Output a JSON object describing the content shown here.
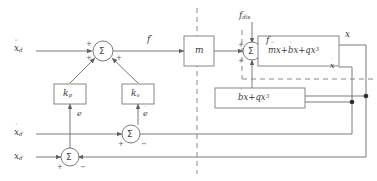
{
  "diagram": {
    "inputs": {
      "accel_ref": {
        "base": "x",
        "accent": "¨",
        "subscript": "d",
        "label": "ẍ_d"
      },
      "vel_ref": {
        "base": "x",
        "accent": "˙",
        "subscript": "d",
        "label": "ẋ_d"
      },
      "pos_ref": {
        "base": "x",
        "accent": "",
        "subscript": "d",
        "label": "x_d"
      },
      "disturbance": {
        "base": "f",
        "subscript": "dis",
        "label": "f_dis"
      }
    },
    "signals": {
      "control_force": "f′",
      "total_force": "f",
      "pos_error": "e",
      "vel_error": "ė",
      "position_out": "x",
      "velocity_out": "ẋ"
    },
    "blocks": [
      {
        "id": "kp",
        "base": "k",
        "subscript": "p",
        "label": "k_p",
        "role": "position-gain"
      },
      {
        "id": "kv",
        "base": "k",
        "subscript": "v",
        "label": "k_v",
        "role": "velocity-gain"
      },
      {
        "id": "mass",
        "label": "m",
        "role": "inertia-gain"
      },
      {
        "id": "plant",
        "label": "mẍ+bẋ+qx³",
        "role": "plant-dynamics"
      },
      {
        "id": "feedback",
        "label": "bẋ+qx³",
        "role": "nonlinear-feedback"
      }
    ],
    "summers": [
      {
        "id": "accel-summer",
        "symbol": "Σ",
        "signs": [
          "+",
          "+",
          "+"
        ]
      },
      {
        "id": "force-summer",
        "symbol": "Σ",
        "signs": [
          "+",
          "+"
        ]
      },
      {
        "id": "vel-error-summer",
        "symbol": "Σ",
        "signs": [
          "+",
          "−"
        ]
      },
      {
        "id": "pos-error-summer",
        "symbol": "Σ",
        "signs": [
          "+",
          "−"
        ]
      }
    ],
    "signs": {
      "plus": "+",
      "minus": "−"
    },
    "colors": {
      "line": "#6b6b6b",
      "dashed": "#8a8a8a",
      "block_stroke": "#7a7a7a",
      "text": "#3a3a3a",
      "background": "#ffffff"
    }
  }
}
